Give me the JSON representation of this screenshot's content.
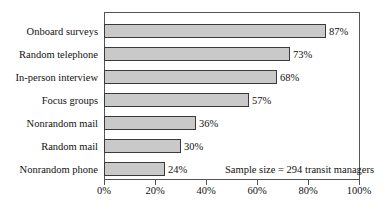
{
  "chart_data": {
    "type": "bar",
    "orientation": "horizontal",
    "title": "",
    "subtitle": "",
    "xlabel": "",
    "ylabel": "",
    "xlim": [
      0,
      100
    ],
    "grid": false,
    "legend": null,
    "categories": [
      "Onboard surveys",
      "Random telephone",
      "In-person interview",
      "Focus groups",
      "Nonrandom mail",
      "Random mail",
      "Nonrandom phone"
    ],
    "values": [
      87,
      73,
      68,
      57,
      36,
      30,
      24
    ],
    "data_labels": [
      "87%",
      "73%",
      "68%",
      "57%",
      "36%",
      "30%",
      "24%"
    ],
    "xticks": [
      0,
      20,
      40,
      60,
      80,
      100
    ],
    "xtick_labels": [
      "0%",
      "20%",
      "40%",
      "60%",
      "80%",
      "100%"
    ],
    "annotations": [
      {
        "text": "Sample size = 294 transit managers"
      }
    ],
    "colors": {
      "bar_fill": "#c9c9c9",
      "bar_edge": "#3a3a3a",
      "frame": "#555555",
      "text": "#111111",
      "background": "#ffffff"
    }
  }
}
